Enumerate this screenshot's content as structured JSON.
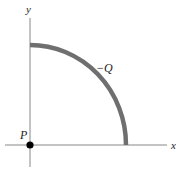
{
  "diagram": {
    "axes": {
      "x_label": "x",
      "y_label": "y"
    },
    "origin_point": {
      "label": "P"
    },
    "arc": {
      "label": "−Q",
      "description": "quarter-circle arc of charge in first quadrant, centered at P"
    },
    "colors": {
      "axis": "#777777",
      "arc": "#6f6f6f",
      "point": "#000000",
      "text": "#222222"
    }
  }
}
